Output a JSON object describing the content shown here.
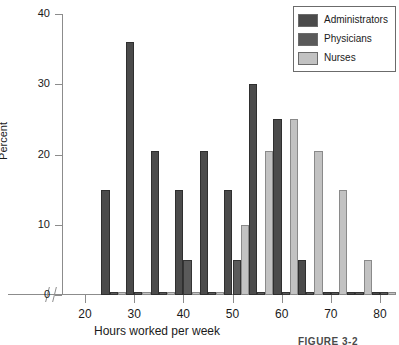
{
  "figure": {
    "caption": "FIGURE 3-2"
  },
  "legend": {
    "position": "top-right",
    "entries": [
      {
        "label": "Administrators",
        "color": "#4b4b4b",
        "key": "administrators"
      },
      {
        "label": "Physicians",
        "color": "#5a5a5a",
        "key": "physicians"
      },
      {
        "label": "Nurses",
        "color": "#c2c2c2",
        "key": "nurses"
      }
    ]
  },
  "axes": {
    "x": {
      "label": "Hours worked per week",
      "ticks": [
        20,
        30,
        40,
        50,
        60,
        70,
        80
      ],
      "min": 20,
      "max": 80,
      "has_break": true
    },
    "y": {
      "label": "Percent",
      "ticks": [
        0,
        10,
        20,
        30,
        40
      ],
      "min": 0,
      "max": 40
    }
  },
  "chart_data": {
    "type": "bar",
    "title": "",
    "xlabel": "Hours worked per week",
    "ylabel": "Percent",
    "xlim": [
      20,
      80
    ],
    "ylim": [
      0,
      40
    ],
    "grid": false,
    "legend_position": "top-right",
    "categories": [
      25,
      30,
      35,
      40,
      45,
      50,
      55,
      60,
      65,
      70,
      75,
      80
    ],
    "series": [
      {
        "name": "Administrators",
        "color": "#4b4b4b",
        "values": [
          15,
          36,
          20.5,
          15,
          20.5,
          15,
          30,
          25,
          5,
          0.5,
          0.5,
          0.5
        ]
      },
      {
        "name": "Physicians",
        "color": "#5a5a5a",
        "values": [
          0.5,
          0.5,
          0.5,
          5,
          0.5,
          5,
          0.5,
          0.5,
          0.5,
          0.5,
          0.5,
          0.5
        ]
      },
      {
        "name": "Nurses",
        "color": "#c2c2c2",
        "values": [
          0.5,
          0.5,
          0.5,
          0.5,
          0.5,
          10,
          20.5,
          25,
          20.5,
          15,
          5,
          0.5
        ]
      }
    ]
  }
}
